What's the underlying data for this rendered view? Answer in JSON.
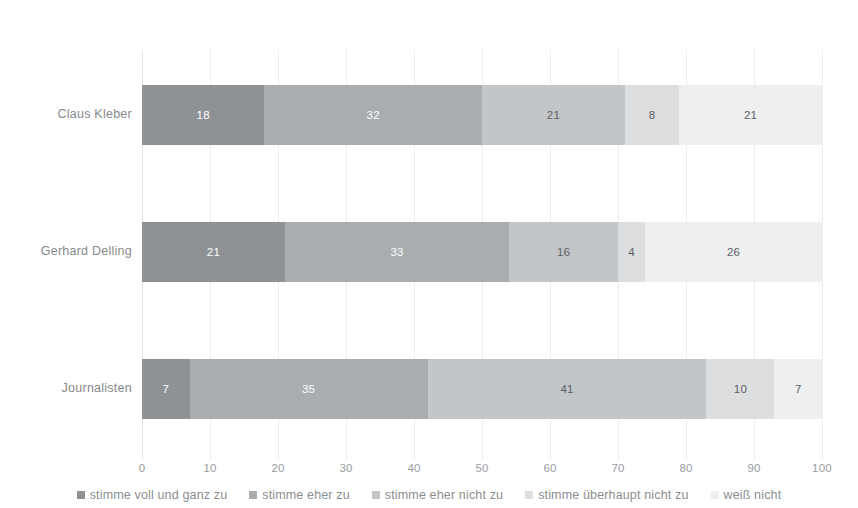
{
  "chart_data": {
    "type": "bar",
    "subtype": "stacked-horizontal-100-percent",
    "title": "",
    "subtitle": "",
    "xlabel": "",
    "ylabel": "",
    "xlim": [
      0,
      100
    ],
    "x_ticks": [
      "0",
      "10",
      "20",
      "30",
      "40",
      "50",
      "60",
      "70",
      "80",
      "90",
      "100"
    ],
    "grid": true,
    "grid_axis": "x",
    "legend_position": "bottom",
    "categories": [
      "Claus Kleber",
      "Gerhard Delling",
      "Journalisten"
    ],
    "series": [
      {
        "name": "stimme voll und ganz zu",
        "color": "#8e9295",
        "values": [
          18,
          21,
          7
        ]
      },
      {
        "name": "stimme eher zu",
        "color": "#a9adb0",
        "values": [
          32,
          33,
          35
        ]
      },
      {
        "name": "stimme eher nicht zu",
        "color": "#c3c6c8",
        "values": [
          21,
          16,
          41
        ]
      },
      {
        "name": "stimme überhaupt nicht zu",
        "color": "#dcdedf",
        "values": [
          8,
          4,
          10
        ]
      },
      {
        "name": "weiß nicht",
        "color": "#eeeff0",
        "values": [
          21,
          26,
          7
        ]
      }
    ]
  },
  "legend": {
    "items": [
      {
        "label": "stimme voll und ganz zu",
        "color": "#8e9295"
      },
      {
        "label": "stimme eher zu",
        "color": "#a9adb0"
      },
      {
        "label": "stimme eher nicht zu",
        "color": "#c3c6c8"
      },
      {
        "label": "stimme überhaupt nicht zu",
        "color": "#dcdedf"
      },
      {
        "label": "weiß nicht",
        "color": "#eeeff0"
      }
    ]
  }
}
